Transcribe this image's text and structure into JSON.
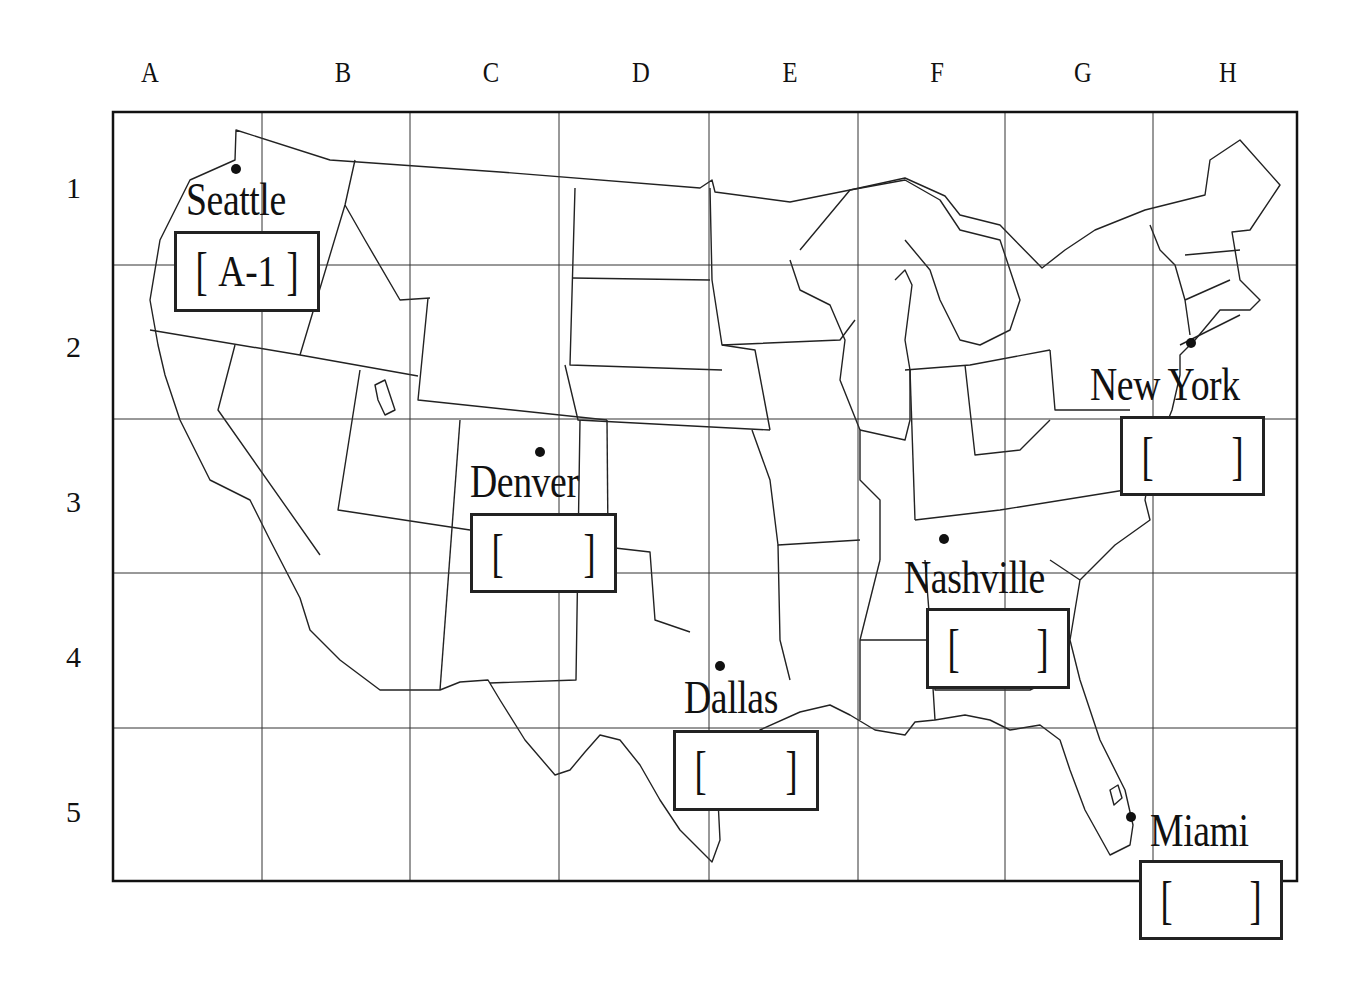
{
  "grid": {
    "columns": [
      "A",
      "B",
      "C",
      "D",
      "E",
      "F",
      "G",
      "H"
    ],
    "rows": [
      "1",
      "2",
      "3",
      "4",
      "5"
    ]
  },
  "cities": [
    {
      "name": "Seattle",
      "answer": "A-1",
      "filled": true
    },
    {
      "name": "Denver",
      "answer": "",
      "filled": false
    },
    {
      "name": "Dallas",
      "answer": "",
      "filled": false
    },
    {
      "name": "Nashville",
      "answer": "",
      "filled": false
    },
    {
      "name": "New York",
      "answer": "",
      "filled": false
    },
    {
      "name": "Miami",
      "answer": "",
      "filled": false
    }
  ],
  "brackets": {
    "open": "[",
    "close": "]"
  },
  "colors": {
    "ink": "#111111",
    "background": "#ffffff"
  }
}
